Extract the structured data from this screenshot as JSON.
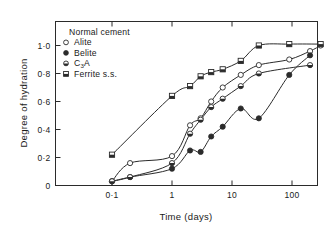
{
  "figure": {
    "background": "#ffffff",
    "ink": "#2b2b2b"
  },
  "legend": {
    "title": "Normal cement",
    "position": "top-left-inside",
    "entries": [
      {
        "label": "Alite",
        "marker": "open-circle-marker",
        "key": "alite"
      },
      {
        "label": "Belite",
        "marker": "filled-circle-marker",
        "key": "belite"
      },
      {
        "label": "C3A",
        "marker": "half-filled-circle-marker",
        "key": "c3a",
        "label_main": "C",
        "label_sub": "3",
        "label_tail": "A"
      },
      {
        "label": "Ferrite s.s.",
        "marker": "half-filled-square-marker",
        "key": "ferrite"
      }
    ]
  },
  "chart_data": {
    "type": "line",
    "title": "",
    "subtitle": "",
    "xlabel": "Time (days)",
    "ylabel": "Degree of hydration",
    "xscale": "log",
    "yscale": "linear",
    "xlim": [
      0.05,
      400
    ],
    "ylim": [
      0,
      1.1
    ],
    "grid": false,
    "legend_position": "upper-left-inside",
    "xticks": [
      0.1,
      1,
      10,
      100
    ],
    "xtick_labels": [
      "0·1",
      "1",
      "10",
      "100"
    ],
    "yticks": [
      0,
      0.2,
      0.4,
      0.6,
      0.8,
      1.0
    ],
    "ytick_labels": [
      "0",
      "0·2",
      "0·4",
      "0·6",
      "0·8",
      "1·0"
    ],
    "series": [
      {
        "name": "Alite",
        "marker": "open-circle",
        "x": [
          0.1,
          0.2,
          1.0,
          2.0,
          3.0,
          4.5,
          7.0,
          14.0,
          28.0,
          90.0,
          200.0,
          300.0
        ],
        "y": [
          0.03,
          0.16,
          0.21,
          0.43,
          0.48,
          0.6,
          0.7,
          0.79,
          0.86,
          0.9,
          0.96,
          1.0
        ]
      },
      {
        "name": "Belite",
        "marker": "filled-circle",
        "x": [
          0.1,
          0.2,
          1.0,
          2.0,
          3.0,
          4.5,
          7.0,
          14.0,
          28.0,
          90.0,
          200.0
        ],
        "y": [
          0.03,
          0.06,
          0.12,
          0.25,
          0.24,
          0.35,
          0.42,
          0.55,
          0.48,
          0.79,
          0.93
        ]
      },
      {
        "name": "C3A",
        "marker": "half-filled-circle",
        "x": [
          0.1,
          0.2,
          1.0,
          2.0,
          3.0,
          4.5,
          7.0,
          14.0,
          28.0,
          200.0
        ],
        "y": [
          0.03,
          0.06,
          0.16,
          0.37,
          0.47,
          0.56,
          0.62,
          0.71,
          0.8,
          0.86
        ]
      },
      {
        "name": "Ferrite s.s.",
        "marker": "half-filled-square",
        "x": [
          0.1,
          1.0,
          2.0,
          3.0,
          4.5,
          7.0,
          14.0,
          28.0,
          90.0,
          300.0
        ],
        "y": [
          0.22,
          0.64,
          0.71,
          0.78,
          0.81,
          0.83,
          0.89,
          1.0,
          1.01,
          1.01
        ]
      }
    ]
  }
}
